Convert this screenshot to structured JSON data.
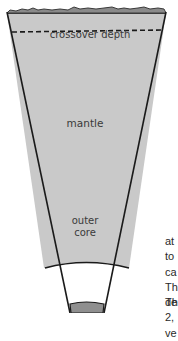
{
  "figure": {
    "type": "earth-interior-wedge",
    "layers": [
      {
        "name": "crust",
        "color": "#8a8a8a"
      },
      {
        "name": "mantle",
        "label": "mantle",
        "color": "#c9c9c9"
      },
      {
        "name": "outer core",
        "label": "outer core",
        "color": "#ffffff"
      },
      {
        "name": "inner core",
        "color": "#8f8f8f"
      }
    ],
    "crossover_label": "crossover depth",
    "mantle_label": "mantle",
    "outer_core_label_line1": "outer",
    "outer_core_label_line2": "core"
  },
  "body_text": {
    "lines": [
      "at",
      "to",
      "ca",
      "Th",
      "de",
      "2,",
      "ve"
    ],
    "last_line": "Th"
  }
}
